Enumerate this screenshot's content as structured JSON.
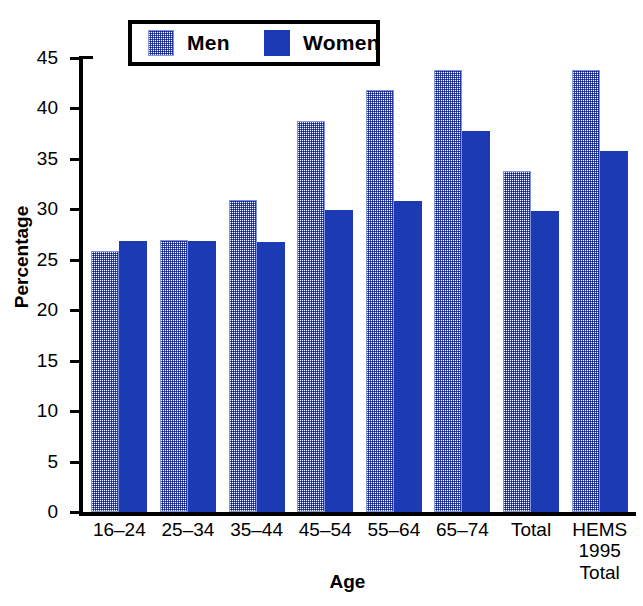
{
  "chart_data": {
    "type": "bar",
    "title": "",
    "xlabel": "Age",
    "ylabel": "Percentage",
    "ylim": [
      0,
      45
    ],
    "ytick_step": 5,
    "yticks": [
      45,
      40,
      35,
      30,
      25,
      20,
      15,
      10,
      5,
      0
    ],
    "grid": false,
    "legend_position": "top-center",
    "categories": [
      "16–24",
      "25–34",
      "35–44",
      "45–54",
      "55–64",
      "65–74",
      "Total",
      "HEMS\n1995\nTotal"
    ],
    "series": [
      {
        "name": "Men",
        "color": "#3c52b8",
        "fill": "dotted-pattern",
        "values": [
          25.9,
          27.0,
          30.9,
          38.8,
          41.8,
          43.8,
          33.8,
          43.8
        ]
      },
      {
        "name": "Women",
        "color": "#1b3ab4",
        "fill": "solid",
        "values": [
          26.9,
          26.9,
          26.8,
          29.9,
          30.8,
          37.8,
          29.8,
          35.8
        ]
      }
    ]
  },
  "legend": {
    "entries": [
      {
        "label": "Men"
      },
      {
        "label": "Women"
      }
    ]
  },
  "colors": {
    "men_pattern": "#3c52b8",
    "women_solid": "#1b3ab4",
    "axis": "#000000",
    "background": "#ffffff"
  }
}
